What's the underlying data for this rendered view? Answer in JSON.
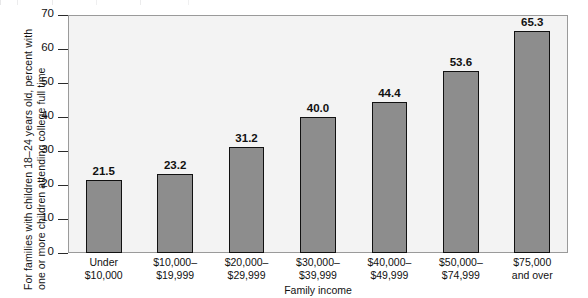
{
  "chart_data": {
    "type": "bar",
    "title": "",
    "xlabel": "Family income",
    "ylabel": "For families with children 18–24 years old, percent with one or more children attending college full time",
    "categories": [
      "Under\n$10,000",
      "$10,000–\n$19,999",
      "$20,000–\n$29,999",
      "$30,000–\n$39,999",
      "$40,000–\n$49,999",
      "$50,000–\n$74,999",
      "$75,000\nand over"
    ],
    "values": [
      21.5,
      23.2,
      31.2,
      40.0,
      44.4,
      53.6,
      65.3
    ],
    "value_labels": [
      "21.5",
      "23.2",
      "31.2",
      "40.0",
      "44.4",
      "53.6",
      "65.3"
    ],
    "ylim": [
      0,
      70
    ],
    "yticks": [
      0,
      10,
      20,
      30,
      40,
      50,
      60,
      70
    ],
    "ytick_labels": [
      "0",
      "10",
      "20",
      "30",
      "40",
      "50",
      "60",
      "70"
    ],
    "grid": false,
    "legend": null,
    "colors": {
      "bar_fill": "#8d8d8d",
      "bar_border": "#111111",
      "plot_background": "#f3f3f3",
      "plot_border": "#9a9a9a",
      "text": "#111111"
    }
  }
}
